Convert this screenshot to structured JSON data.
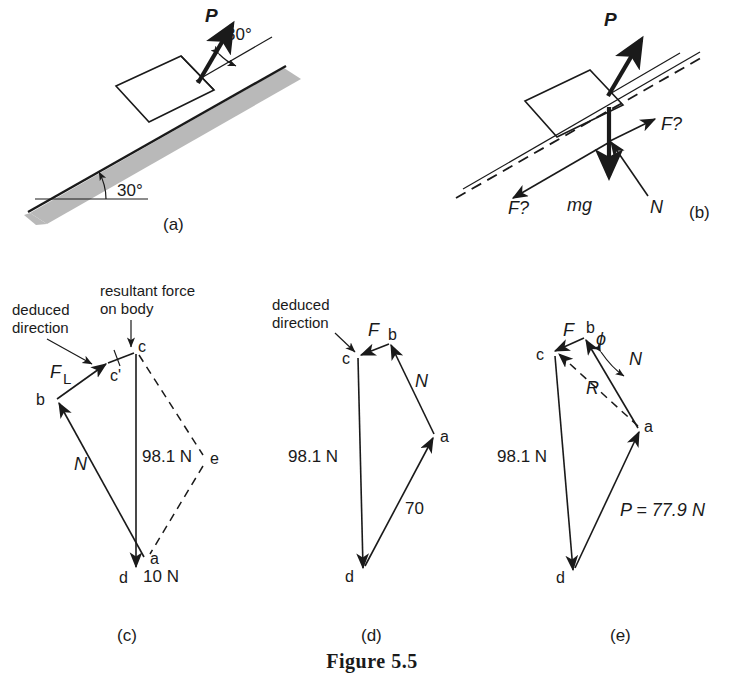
{
  "figure": {
    "caption": "Figure 5.5",
    "panels": [
      {
        "tag": "(a)",
        "name": "block-on-incline",
        "labels": {
          "force_p": "P",
          "angle_force": "30°",
          "angle_incline": "30°"
        }
      },
      {
        "tag": "(b)",
        "name": "free-body-diagram",
        "labels": {
          "force_p": "P",
          "friction_up": "F?",
          "friction_down": "F?",
          "weight": "mg",
          "normal": "N"
        }
      },
      {
        "tag": "(c)",
        "name": "force-polygon-c",
        "labels": {
          "note_deduced": "deduced\ndirection",
          "note_deduced_line1": "deduced",
          "note_deduced_line2": "direction",
          "note_resultant_line1": "resultant force",
          "note_resultant_line2": "on body",
          "friction": "F",
          "friction_sub": "L",
          "normal": "N",
          "weight_value": "98.1 N",
          "applied_value": "10 N",
          "vertex_a": "a",
          "vertex_b": "b",
          "vertex_c": "c",
          "vertex_cprime": "c'",
          "vertex_d": "d",
          "vertex_e": "e"
        }
      },
      {
        "tag": "(d)",
        "name": "force-polygon-d",
        "labels": {
          "note_deduced_line1": "deduced",
          "note_deduced_line2": "direction",
          "friction": "F",
          "normal": "N",
          "weight_value": "98.1 N",
          "applied_value": "70",
          "vertex_a": "a",
          "vertex_b": "b",
          "vertex_c": "c",
          "vertex_d": "d"
        }
      },
      {
        "tag": "(e)",
        "name": "force-polygon-e",
        "labels": {
          "friction": "F",
          "normal": "N",
          "resultant": "R",
          "angle_phi": "ϕ",
          "weight_value": "98.1 N",
          "applied_value": "P = 77.9 N",
          "vertex_a": "a",
          "vertex_b": "b",
          "vertex_c": "c",
          "vertex_d": "d"
        }
      }
    ]
  },
  "colors": {
    "ink": "#1a1a1a",
    "hatch": "#b9b9b9",
    "background": "#ffffff"
  }
}
